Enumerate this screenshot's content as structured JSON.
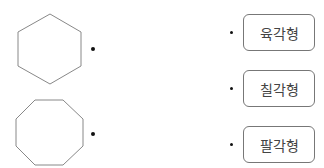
{
  "shapes": [
    {
      "name": "hexagon",
      "sides": 6
    },
    {
      "name": "octagon",
      "sides": 8
    }
  ],
  "labels": [
    "육각형",
    "칠각형",
    "팔각형"
  ],
  "colors": {
    "stroke": "#777777",
    "dot": "#111111",
    "text": "#444444"
  }
}
